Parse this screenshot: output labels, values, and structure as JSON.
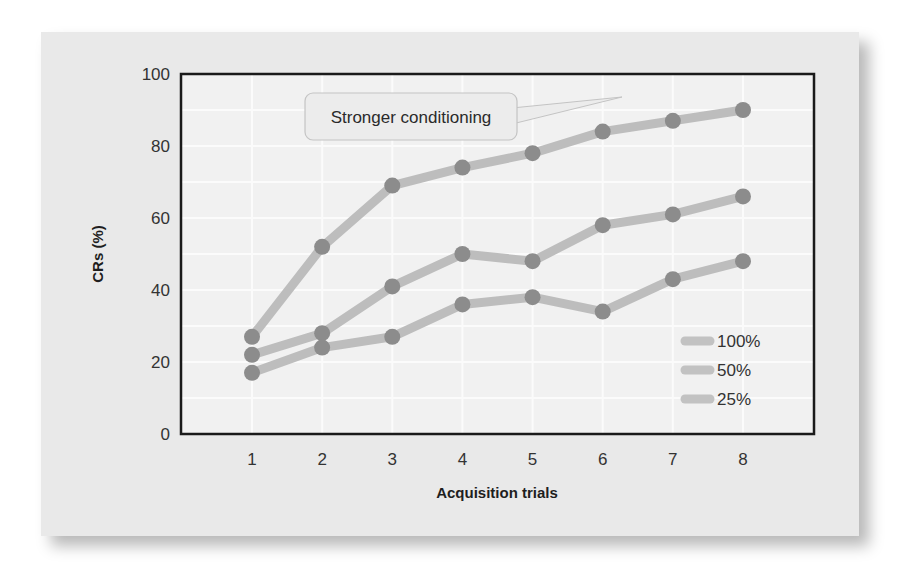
{
  "chart_data": {
    "type": "line",
    "title": "",
    "xlabel": "Acquisition trials",
    "ylabel": "CRs (%)",
    "x": [
      1,
      2,
      3,
      4,
      5,
      6,
      7,
      8
    ],
    "xticks": [
      "1",
      "2",
      "3",
      "4",
      "5",
      "6",
      "7",
      "8"
    ],
    "yticks": [
      "0",
      "20",
      "40",
      "60",
      "80",
      "100"
    ],
    "ylim": [
      0,
      100
    ],
    "grid": true,
    "legend_position": "lower right (inside plot)",
    "series": [
      {
        "name": "100%",
        "values": [
          27,
          52,
          69,
          74,
          78,
          84,
          87,
          90
        ]
      },
      {
        "name": "50%",
        "values": [
          22,
          28,
          41,
          50,
          48,
          58,
          61,
          66
        ]
      },
      {
        "name": "25%",
        "values": [
          17,
          24,
          27,
          36,
          38,
          34,
          43,
          48
        ]
      }
    ],
    "annotations": [
      {
        "text": "Stronger conditioning",
        "points_to": "upper region of plot (100% series)"
      }
    ]
  },
  "colors": {
    "panel_bg": "#e9e9e9",
    "plot_bg": "#f1f1f1",
    "gridline": "#fbfbfb",
    "axis_frame": "#1a1a1a",
    "series_line": "#bdbdbd",
    "series_marker": "#8c8c8c",
    "legend_swatch": "#c2c2c2",
    "callout_bg": "#ececec",
    "callout_border": "#c4c4c4"
  },
  "legend": {
    "items": [
      {
        "label": "100%"
      },
      {
        "label": "50%"
      },
      {
        "label": "25%"
      }
    ]
  },
  "callout": {
    "text": "Stronger conditioning"
  }
}
